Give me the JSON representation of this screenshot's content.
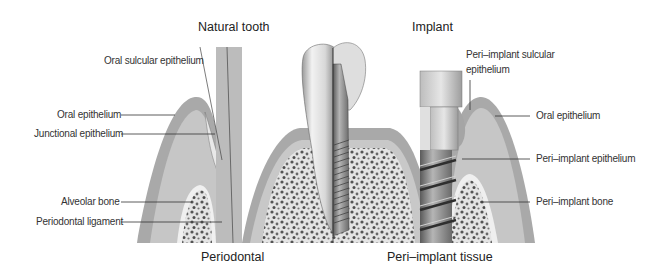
{
  "titles": {
    "natural_tooth": "Natural tooth",
    "implant": "Implant",
    "periodontal": "Periodontal",
    "peri_implant_tissue": "Peri–implant tissue"
  },
  "left_labels": {
    "oral_sulcular_epithelium": "Oral sulcular epithelium",
    "oral_epithelium": "Oral epithelium",
    "junctional_epithelium": "Junctional epithelium",
    "alveolar_bone": "Alveolar bone",
    "periodontal_ligament": "Periodontal ligament"
  },
  "right_labels": {
    "peri_implant_sulcular_epithelium_line1": "Peri–implant sulcular",
    "peri_implant_sulcular_epithelium_line2": "epithelium",
    "oral_epithelium": "Oral epithelium",
    "peri_implant_epithelium": "Peri–implant epithelium",
    "peri_implant_bone": "Peri–implant bone"
  },
  "colors": {
    "gingiva_outer": "#a9a9a9",
    "gingiva_inner": "#c4c4c4",
    "bone_bg": "#e6e6e6",
    "bone_dots": "#555555",
    "tooth_root": "#bdbdbd",
    "implant_metal": "#8a8a8a"
  }
}
